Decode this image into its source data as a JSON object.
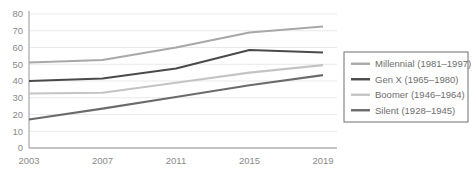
{
  "chart_data": {
    "type": "line",
    "title": "",
    "xlabel": "",
    "ylabel": "",
    "categories": [
      "2003",
      "2007",
      "2011",
      "2015",
      "2019"
    ],
    "x": [
      2003,
      2007,
      2011,
      2015,
      2019
    ],
    "ylim": [
      0,
      80
    ],
    "yticks": [
      0,
      10,
      20,
      30,
      40,
      50,
      60,
      70,
      80
    ],
    "ytick_labels": [
      "0",
      "10",
      "20",
      "30",
      "40",
      "50",
      "60",
      "70",
      "80"
    ],
    "grid": true,
    "legend_position": "right",
    "series": [
      {
        "name": "Millennial (1981–1997)",
        "color": "#a8a8a8",
        "values": [
          51,
          52.5,
          60,
          69,
          72.5
        ]
      },
      {
        "name": "Gen X (1965–1980)",
        "color": "#4a4a4a",
        "values": [
          40,
          41.5,
          47.5,
          58.5,
          57
        ]
      },
      {
        "name": "Boomer (1946–1964)",
        "color": "#c4c4c4",
        "values": [
          32.5,
          33,
          39,
          45,
          49.5
        ]
      },
      {
        "name": "Silent (1928–1945)",
        "color": "#6b6b6b",
        "values": [
          17,
          23.5,
          30.5,
          37.5,
          43.5
        ]
      }
    ]
  },
  "axes": {
    "y_tick_labels": [
      "80",
      "70",
      "60",
      "50",
      "40",
      "30",
      "20",
      "10",
      "0"
    ],
    "x_tick_labels": [
      "2003",
      "2007",
      "2011",
      "2015",
      "2019"
    ]
  },
  "legend": {
    "items": [
      {
        "label": "Millennial (1981–1997)",
        "color": "#a8a8a8"
      },
      {
        "label": "Gen X (1965–1980)",
        "color": "#4a4a4a"
      },
      {
        "label": "Boomer (1946–1964)",
        "color": "#c4c4c4"
      },
      {
        "label": "Silent (1928–1945)",
        "color": "#6b6b6b"
      }
    ]
  },
  "colors": {
    "gridline": "#e9e9e9",
    "axis": "#b4b4b4",
    "tick_text": "#8a8a8a",
    "legend_text": "#6e6e6e",
    "legend_border": "#6f6f6f",
    "background": "#ffffff"
  }
}
